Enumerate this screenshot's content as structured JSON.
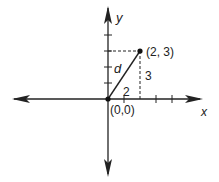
{
  "diagram": {
    "axes": {
      "x_label": "x",
      "y_label": "y"
    },
    "points": {
      "origin_label": "(0,0)",
      "point_label": "(2, 3)"
    },
    "segments": {
      "hypotenuse_label": "d",
      "horizontal_leg_label": "2",
      "vertical_leg_label": "3"
    },
    "ticks": {
      "x_positive": [
        1,
        2,
        3,
        4
      ],
      "y_positive": [
        1,
        2,
        3,
        4
      ]
    },
    "colors": {
      "line": "#222222",
      "background": "#ffffff"
    }
  }
}
